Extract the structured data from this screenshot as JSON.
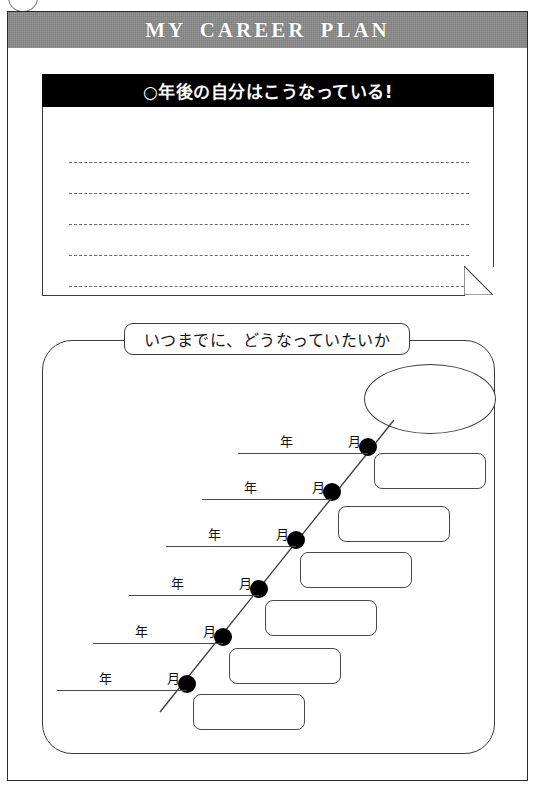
{
  "page": {
    "title": "MY CAREER PLAN",
    "corner_marker": "circle-marker"
  },
  "note_card": {
    "header": "○年後の自分はこうなっている!",
    "line_count": 5,
    "lines": [
      "",
      "",
      "",
      "",
      ""
    ],
    "fold_corner": "dog-ear-fold"
  },
  "roadmap": {
    "label": "いつまでに、どうなっていたいか",
    "goal_bubble": "",
    "rows": [
      {
        "year_label": "年",
        "month_label": "月",
        "year_value": "",
        "month_value": "",
        "note": ""
      },
      {
        "year_label": "年",
        "month_label": "月",
        "year_value": "",
        "month_value": "",
        "note": ""
      },
      {
        "year_label": "年",
        "month_label": "月",
        "year_value": "",
        "month_value": "",
        "note": ""
      },
      {
        "year_label": "年",
        "month_label": "月",
        "year_value": "",
        "month_value": "",
        "note": ""
      },
      {
        "year_label": "年",
        "month_label": "月",
        "year_value": "",
        "month_value": "",
        "note": ""
      },
      {
        "year_label": "年",
        "month_label": "月",
        "year_value": "",
        "month_value": "",
        "note": ""
      }
    ]
  },
  "colors": {
    "title_band": "#7f7f7f",
    "title_text": "#ffffff",
    "note_header_bg": "#000000",
    "note_header_text": "#ffffff",
    "ink": "#3a3a3a",
    "paper": "#ffffff",
    "dot": "#000000"
  }
}
